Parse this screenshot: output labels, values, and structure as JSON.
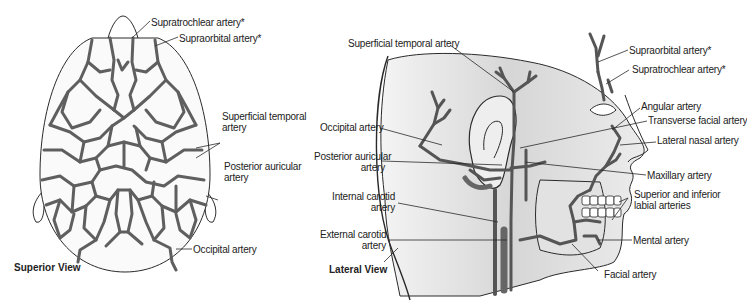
{
  "figure": {
    "panels": [
      {
        "id": "superior",
        "view_label": "Superior View",
        "labels": [
          {
            "text": "Supratrochlear artery*"
          },
          {
            "text": "Supraorbital artery*"
          },
          {
            "text": "Superficial temporal",
            "text2": "artery"
          },
          {
            "text": "Posterior auricular",
            "text2": "artery"
          },
          {
            "text": "Occipital artery"
          }
        ]
      },
      {
        "id": "lateral",
        "view_label": "Lateral View",
        "labels_left": [
          {
            "text": "Superficial temporal artery"
          },
          {
            "text": "Occipital artery"
          },
          {
            "text": "Posterior auricular",
            "text2": "artery"
          },
          {
            "text": "Internal carotid",
            "text2": "artery"
          },
          {
            "text": "External carotid",
            "text2": "artery"
          }
        ],
        "labels_right": [
          {
            "text": "Supraorbital artery*"
          },
          {
            "text": "Supratrochlear artery*"
          },
          {
            "text": "Angular artery"
          },
          {
            "text": "Transverse facial artery"
          },
          {
            "text": "Lateral nasal artery"
          },
          {
            "text": "Maxillary artery"
          },
          {
            "text": "Superior and inferior",
            "text2": "labial arteries"
          },
          {
            "text": "Mental artery"
          },
          {
            "text": "Facial artery"
          }
        ]
      }
    ],
    "colors": {
      "artery": "#5f5f5f",
      "outline": "#2a2a2a",
      "skin_shade": "#d8d8d8",
      "background": "#ffffff"
    }
  }
}
